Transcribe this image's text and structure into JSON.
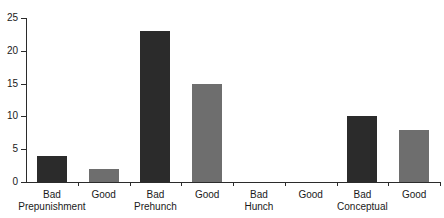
{
  "chart_data": {
    "type": "bar",
    "title": "",
    "subtitle": "",
    "xlabel": "",
    "ylabel": "",
    "ylim": [
      0,
      25
    ],
    "ytick_labels": [
      "0",
      "5",
      "10",
      "15",
      "20",
      "25"
    ],
    "yticks": [
      0,
      5,
      10,
      15,
      20,
      25
    ],
    "grid": false,
    "legend": null,
    "categories": [
      "Bad",
      "Good",
      "Bad",
      "Good",
      "Bad",
      "Good",
      "Bad",
      "Good"
    ],
    "values": [
      4,
      2,
      23,
      15,
      0,
      0,
      10,
      8
    ],
    "groups": [
      {
        "name": "Prepunishment",
        "bars": [
          {
            "label": "Bad",
            "value": 4,
            "color": "#2b2b2b"
          },
          {
            "label": "Good",
            "value": 2,
            "color": "#6e6e6e"
          }
        ]
      },
      {
        "name": "Prehunch",
        "bars": [
          {
            "label": "Bad",
            "value": 23,
            "color": "#2b2b2b"
          },
          {
            "label": "Good",
            "value": 15,
            "color": "#6e6e6e"
          }
        ]
      },
      {
        "name": "Hunch",
        "bars": [
          {
            "label": "Bad",
            "value": 0,
            "color": "#2b2b2b"
          },
          {
            "label": "Good",
            "value": 0,
            "color": "#6e6e6e"
          }
        ]
      },
      {
        "name": "Conceptual",
        "bars": [
          {
            "label": "Bad",
            "value": 10,
            "color": "#2b2b2b"
          },
          {
            "label": "Good",
            "value": 8,
            "color": "#6e6e6e"
          }
        ]
      }
    ],
    "colors": {
      "bad": "#2b2b2b",
      "good": "#6e6e6e",
      "axis": "#2b2b2b",
      "background": "#ffffff",
      "text": "#1a1a1a"
    }
  }
}
